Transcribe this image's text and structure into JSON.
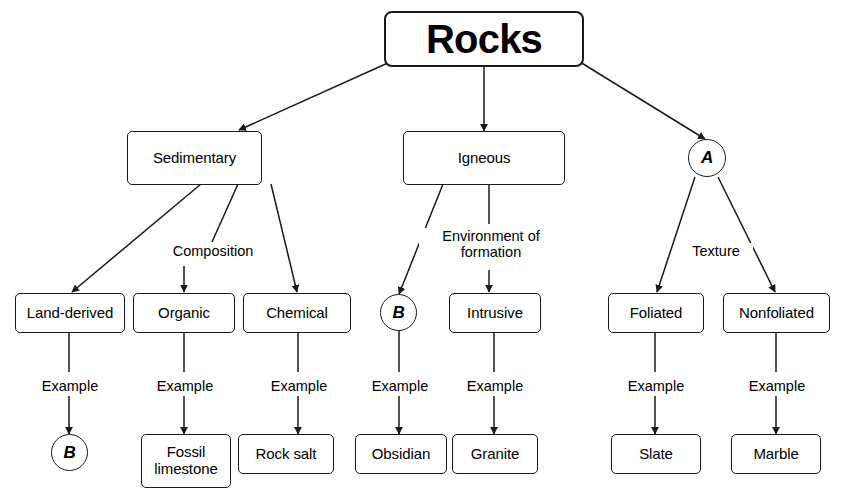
{
  "diagram": {
    "stroke_color": "#1a1a1a",
    "text_color": "#000000",
    "background_color": "#ffffff",
    "nodes": {
      "root": {
        "label": "Rocks",
        "shape": "rounded-rect"
      },
      "sedimentary": {
        "label": "Sedimentary",
        "shape": "rounded-rect"
      },
      "igneous": {
        "label": "Igneous",
        "shape": "rounded-rect"
      },
      "metamorphic_blank": {
        "label": "A",
        "shape": "circle"
      },
      "land_derived": {
        "label": "Land-derived",
        "shape": "rounded-rect"
      },
      "organic": {
        "label": "Organic",
        "shape": "rounded-rect"
      },
      "chemical": {
        "label": "Chemical",
        "shape": "rounded-rect"
      },
      "extrusive_blank": {
        "label": "B",
        "shape": "circle"
      },
      "intrusive": {
        "label": "Intrusive",
        "shape": "rounded-rect"
      },
      "foliated": {
        "label": "Foliated",
        "shape": "rounded-rect"
      },
      "nonfoliated": {
        "label": "Nonfoliated",
        "shape": "rounded-rect"
      },
      "land_derived_example": {
        "label": "B",
        "shape": "circle"
      },
      "fossil_limestone": {
        "label": "Fossil\nlimestone",
        "shape": "rounded-rect"
      },
      "rock_salt": {
        "label": "Rock salt",
        "shape": "rounded-rect"
      },
      "obsidian": {
        "label": "Obsidian",
        "shape": "rounded-rect"
      },
      "granite": {
        "label": "Granite",
        "shape": "rounded-rect"
      },
      "slate": {
        "label": "Slate",
        "shape": "rounded-rect"
      },
      "marble": {
        "label": "Marble",
        "shape": "rounded-rect"
      }
    },
    "edge_labels": {
      "composition": "Composition",
      "environment_of_formation": "Environment of\nformation",
      "texture": "Texture",
      "example_land_derived": "Example",
      "example_organic": "Example",
      "example_chemical": "Example",
      "example_extrusive": "Example",
      "example_intrusive": "Example",
      "example_foliated": "Example",
      "example_nonfoliated": "Example"
    }
  }
}
